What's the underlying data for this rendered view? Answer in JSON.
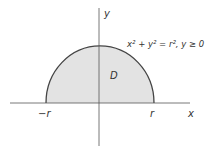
{
  "diagram": {
    "region_label": "D",
    "equation": "x² + y² = r², y ≥ 0",
    "axes": {
      "x_label": "x",
      "y_label": "y"
    },
    "ticks": {
      "neg_r": "−r",
      "pos_r": "r"
    },
    "colors": {
      "fill": "#e3e3e3",
      "stroke": "#444444",
      "axis": "#555555"
    }
  }
}
